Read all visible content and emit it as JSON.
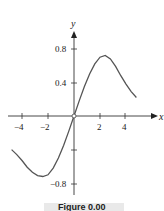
{
  "chart_data": {
    "type": "line",
    "title": "",
    "xlabel": "x",
    "ylabel": "y",
    "xlim": [
      -4.8,
      5.8
    ],
    "ylim": [
      -1.0,
      1.0
    ],
    "grid": false,
    "x_ticks": [
      -4,
      -2,
      2,
      4
    ],
    "x_tick_labels": [
      "−4",
      "−2",
      "2",
      "4"
    ],
    "y_ticks": [
      0.8,
      0.4,
      -0.4,
      -0.8
    ],
    "y_tick_labels": [
      "0.8",
      "0.4",
      "",
      "−0.8"
    ],
    "series": [
      {
        "name": "f(x)",
        "color": "#555555",
        "x": [
          -4.8,
          -4.4,
          -4.0,
          -3.6,
          -3.2,
          -2.8,
          -2.4,
          -2.0,
          -1.6,
          -1.2,
          -0.8,
          -0.4,
          0.0,
          0.4,
          0.8,
          1.2,
          1.6,
          2.0,
          2.4,
          2.8,
          3.2,
          3.6,
          4.0,
          4.4,
          4.8
        ],
        "y": [
          -0.4,
          -0.46,
          -0.53,
          -0.61,
          -0.67,
          -0.71,
          -0.72,
          -0.7,
          -0.62,
          -0.5,
          -0.35,
          -0.18,
          0.0,
          0.18,
          0.35,
          0.5,
          0.62,
          0.7,
          0.72,
          0.68,
          0.59,
          0.48,
          0.38,
          0.29,
          0.22
        ]
      }
    ],
    "annotations": [
      "open circle at origin"
    ]
  },
  "caption": "Figure 0.00"
}
